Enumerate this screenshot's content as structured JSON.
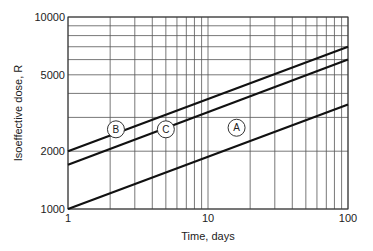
{
  "chart_data": {
    "type": "line",
    "title": "",
    "xlabel": "Time, days",
    "ylabel": "Isoeffective dose, R",
    "xscale": "log",
    "yscale": "log",
    "xlim": [
      1,
      100
    ],
    "ylim": [
      1000,
      10000
    ],
    "x_ticks": [
      1,
      10,
      100
    ],
    "x_tick_labels": [
      "1",
      "10",
      "100"
    ],
    "y_ticks": [
      1000,
      2000,
      5000,
      10000
    ],
    "y_tick_labels": [
      "1000",
      "2000",
      "5000",
      "10000"
    ],
    "grid": true,
    "legend": "inline circled labels",
    "series": [
      {
        "name": "A",
        "x": [
          1,
          100
        ],
        "values": [
          1000,
          3500
        ]
      },
      {
        "name": "B",
        "x": [
          1,
          100
        ],
        "values": [
          2000,
          7000
        ]
      },
      {
        "name": "C",
        "x": [
          1,
          100
        ],
        "values": [
          1700,
          6000
        ]
      }
    ],
    "annotations": [
      {
        "text": "A",
        "x": 16,
        "y": 2650
      },
      {
        "text": "B",
        "x": 2.2,
        "y": 2600
      },
      {
        "text": "C",
        "x": 5.0,
        "y": 2600
      }
    ]
  }
}
